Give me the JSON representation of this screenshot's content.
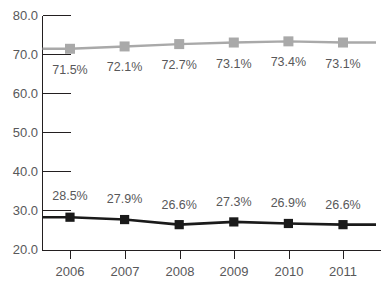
{
  "chart_data": {
    "type": "line",
    "title": "",
    "subtitle": "",
    "xlabel": "",
    "ylabel": "",
    "categories": [
      "2006",
      "2007",
      "2008",
      "2009",
      "2010",
      "2011"
    ],
    "x": [
      2006,
      2007,
      2008,
      2009,
      2010,
      2011
    ],
    "ylim": [
      20.0,
      80.0
    ],
    "yticks": [
      "20.0",
      "30.0",
      "40.0",
      "50.0",
      "60.0",
      "70.0",
      "80.0"
    ],
    "ytick_values": [
      20.0,
      30.0,
      40.0,
      50.0,
      60.0,
      70.0,
      80.0
    ],
    "grid": false,
    "legend": "none",
    "series": [
      {
        "name": "upper-series",
        "color": "#a9a9a9",
        "marker": "square",
        "label_position": "below",
        "values": [
          71.5,
          72.1,
          72.7,
          73.1,
          73.4,
          73.1
        ],
        "labels": [
          "71.5%",
          "72.1%",
          "72.7%",
          "73.1%",
          "73.4%",
          "73.1%"
        ]
      },
      {
        "name": "lower-series",
        "color": "#1a1a1a",
        "marker": "square",
        "label_position": "above",
        "values": [
          28.5,
          27.9,
          26.6,
          27.3,
          26.9,
          26.6
        ],
        "labels": [
          "28.5%",
          "27.9%",
          "26.6%",
          "27.3%",
          "26.9%",
          "26.6%"
        ]
      }
    ]
  },
  "axes": {
    "axis_color": "#231f20",
    "tick_text_color": "#58585a"
  }
}
